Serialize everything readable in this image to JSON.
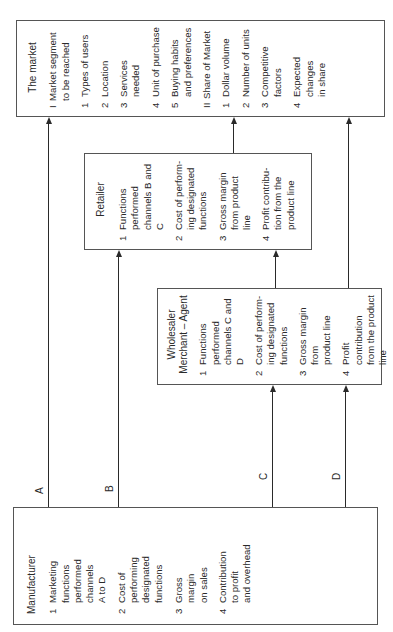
{
  "diagram": {
    "orientation": "rotated-90-ccw",
    "nodes": {
      "market": {
        "title": "The market",
        "sections": [
          {
            "heading_num": "I",
            "heading": "Market segment\nto be reached",
            "items": [
              {
                "num": "1",
                "text": "Types of users"
              },
              {
                "num": "2",
                "text": "Location"
              },
              {
                "num": "3",
                "text": "Services needed"
              },
              {
                "num": "4",
                "text": "Unit of purchase"
              },
              {
                "num": "5",
                "text": "Buying habits\nand preferences"
              }
            ]
          },
          {
            "heading_num": "II",
            "heading": "Share of Market",
            "items": [
              {
                "num": "1",
                "text": "Dollar volume"
              },
              {
                "num": "2",
                "text": "Number of units"
              },
              {
                "num": "3",
                "text": "Competitive\nfactors"
              },
              {
                "num": "4",
                "text": "Expected changes\nin share"
              }
            ]
          }
        ]
      },
      "retailer": {
        "title": "Retailer",
        "items": [
          {
            "num": "1",
            "text": "Functions performed\nchannels B and C"
          },
          {
            "num": "2",
            "text": "Cost of perform-\ning designated\nfunctions"
          },
          {
            "num": "3",
            "text": "Gross margin\nfrom product\nline"
          },
          {
            "num": "4",
            "text": "Profit contribu-\ntion from the\nproduct line"
          }
        ]
      },
      "wholesaler": {
        "title": "Wholesaler\nMerchant – Agent",
        "items": [
          {
            "num": "1",
            "text": "Functions performed\nchannels C and D"
          },
          {
            "num": "2",
            "text": "Cost of perform-\ning designated\nfunctions"
          },
          {
            "num": "3",
            "text": "Gross margin from\nproduct line"
          },
          {
            "num": "4",
            "text": "Profit contribution\nfrom the product\nline"
          }
        ]
      },
      "manufacturer": {
        "title": "Manufacturer",
        "items": [
          {
            "num": "1",
            "text": "Marketing\nfunctions\nperformed\nchannels\nA to D"
          },
          {
            "num": "2",
            "text": "Cost of\nperforming\ndesignated\nfunctions"
          },
          {
            "num": "3",
            "text": "Gross\nmargin\non sales"
          },
          {
            "num": "4",
            "text": "Contribution\nto profit\nand overhead"
          }
        ]
      }
    },
    "channels": [
      {
        "label": "A",
        "from": "manufacturer",
        "to": "market"
      },
      {
        "label": "B",
        "from": "manufacturer",
        "to": "retailer"
      },
      {
        "label": "C",
        "from": "manufacturer",
        "to": "wholesaler"
      },
      {
        "label": "D",
        "from": "manufacturer",
        "to": "wholesaler"
      }
    ],
    "edges": [
      {
        "from": "manufacturer",
        "to": "market",
        "channel": "A"
      },
      {
        "from": "manufacturer",
        "to": "retailer",
        "channel": "B"
      },
      {
        "from": "manufacturer",
        "to": "wholesaler",
        "channel": "C"
      },
      {
        "from": "manufacturer",
        "to": "wholesaler",
        "channel": "D"
      },
      {
        "from": "wholesaler",
        "to": "retailer"
      },
      {
        "from": "retailer",
        "to": "market"
      },
      {
        "from": "wholesaler",
        "to": "market"
      }
    ],
    "colors": {
      "line": "#2a2a2a",
      "border": "#555555",
      "background": "#ffffff"
    }
  }
}
